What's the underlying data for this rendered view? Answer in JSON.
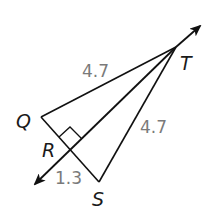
{
  "diagram": {
    "type": "geometry-triangle-with-perpendicular-bisector",
    "colors": {
      "line": "#111111",
      "length_label": "#7a7a7a",
      "point_label": "#1a1a1a",
      "background": "#ffffff"
    },
    "points": {
      "T": {
        "label": "T",
        "x": 176,
        "y": 47
      },
      "Q": {
        "label": "Q",
        "x": 41,
        "y": 117
      },
      "S": {
        "label": "S",
        "x": 99,
        "y": 182
      },
      "R": {
        "label": "R",
        "x": 70,
        "y": 150
      }
    },
    "segments": [
      {
        "from": "T",
        "to": "Q"
      },
      {
        "from": "T",
        "to": "S"
      },
      {
        "from": "Q",
        "to": "S"
      }
    ],
    "line": {
      "through": [
        "T",
        "R"
      ],
      "arrows": "both",
      "description": "line TR"
    },
    "right_angle_at": "R",
    "length_labels": {
      "TQ": "4.7",
      "TS": "4.7",
      "RS": "1.3"
    }
  }
}
